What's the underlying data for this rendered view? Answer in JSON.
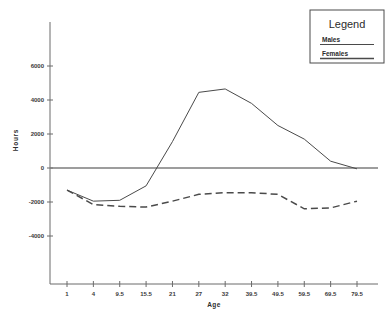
{
  "chart_data": {
    "type": "line",
    "title": "",
    "xlabel": "Age",
    "ylabel": "Hours",
    "categories": [
      "1",
      "4",
      "9.5",
      "15.5",
      "21",
      "27",
      "32",
      "39.5",
      "49.5",
      "59.5",
      "69.5",
      "79.5"
    ],
    "x_tick_labels": [
      "1",
      "4",
      "9.5",
      "15.5",
      "21",
      "27",
      "32",
      "39.5",
      "49.5",
      "59.5",
      "69.5",
      "79.5"
    ],
    "y_tick_labels": [
      "6000",
      "4000",
      "2000",
      "0",
      "-2000",
      "-4000"
    ],
    "y_tick_values": [
      6000,
      4000,
      2000,
      0,
      -2000,
      -4000
    ],
    "ylim": [
      -5600,
      7200
    ],
    "grid": false,
    "legend_position": "top-right",
    "series": [
      {
        "name": "Males",
        "style": "solid",
        "values": [
          -1300,
          -1950,
          -1900,
          -1050,
          1550,
          4450,
          4650,
          3800,
          2500,
          1700,
          400,
          -50
        ]
      },
      {
        "name": "Females",
        "style": "dashed",
        "values": [
          -1300,
          -2150,
          -2250,
          -2300,
          -1950,
          -1550,
          -1450,
          -1450,
          -1550,
          -2400,
          -2350,
          -1950
        ]
      }
    ]
  },
  "legend": {
    "title": "Legend",
    "entries": [
      {
        "label": "Males",
        "style": "solid"
      },
      {
        "label": "Females",
        "style": "dashed"
      }
    ]
  },
  "axes": {
    "x_title": "Age",
    "y_title": "Hours",
    "y_ticks": [
      "6000",
      "4000",
      "2000",
      "0",
      "-2000",
      "-4000"
    ],
    "x_ticks": [
      "1",
      "4",
      "9.5",
      "15.5",
      "21",
      "27",
      "32",
      "39.5",
      "49.5",
      "59.5",
      "69.5",
      "79.5"
    ]
  }
}
